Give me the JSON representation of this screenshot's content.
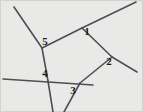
{
  "figure": {
    "background_color": "#e9e9e7",
    "border_color": "#d2d2cf",
    "line_color": "#4c4f55",
    "label_color": "#1b1b1b",
    "width": 143,
    "height": 112
  },
  "chart_data": {
    "type": "diagram",
    "xlabel": "",
    "ylabel": "",
    "xlim": [
      0,
      143
    ],
    "ylim": [
      0,
      112
    ],
    "grid": false,
    "legend": "none",
    "vertices": [
      {
        "id": "V5",
        "label": "5",
        "x": 42,
        "y": 48
      },
      {
        "id": "V1",
        "label": "1",
        "x": 82,
        "y": 28
      },
      {
        "id": "V2",
        "label": "2",
        "x": 112,
        "y": 57
      },
      {
        "id": "V3",
        "label": "3",
        "x": 80,
        "y": 82
      },
      {
        "id": "V4",
        "label": "4",
        "x": 47,
        "y": 80
      }
    ],
    "segments": [
      {
        "id": "line-topleft-to-bottom",
        "x1": 14,
        "y1": 7,
        "x2": 42,
        "y2": 48
      },
      {
        "id": "line-v5-to-v4",
        "x1": 42,
        "y1": 48,
        "x2": 48,
        "y2": 81
      },
      {
        "id": "line-v4-to-bottom",
        "x1": 48,
        "y1": 81,
        "x2": 53,
        "y2": 112
      },
      {
        "id": "line-v5-to-v1",
        "x1": 42,
        "y1": 48,
        "x2": 82,
        "y2": 28
      },
      {
        "id": "line-v1-to-topright",
        "x1": 82,
        "y1": 28,
        "x2": 136,
        "y2": 2
      },
      {
        "id": "line-v1-to-v2",
        "x1": 82,
        "y1": 28,
        "x2": 112,
        "y2": 57
      },
      {
        "id": "line-v2-to-rightedge",
        "x1": 112,
        "y1": 57,
        "x2": 137,
        "y2": 72
      },
      {
        "id": "line-v2-to-v3",
        "x1": 112,
        "y1": 57,
        "x2": 80,
        "y2": 83
      },
      {
        "id": "line-v3-to-bottomedge",
        "x1": 80,
        "y1": 83,
        "x2": 64,
        "y2": 112
      },
      {
        "id": "line-horizontal-left-to-v3",
        "x1": 3,
        "y1": 79,
        "x2": 93,
        "y2": 85
      }
    ],
    "labels": [
      {
        "id": "angle-label-1",
        "text": "1",
        "x": 87,
        "y": 35
      },
      {
        "id": "angle-label-2",
        "text": "2",
        "x": 109,
        "y": 65
      },
      {
        "id": "angle-label-3",
        "text": "3",
        "x": 73,
        "y": 94
      },
      {
        "id": "angle-label-4",
        "text": "4",
        "x": 45,
        "y": 77
      },
      {
        "id": "angle-label-5",
        "text": "5",
        "x": 45,
        "y": 45
      }
    ]
  }
}
